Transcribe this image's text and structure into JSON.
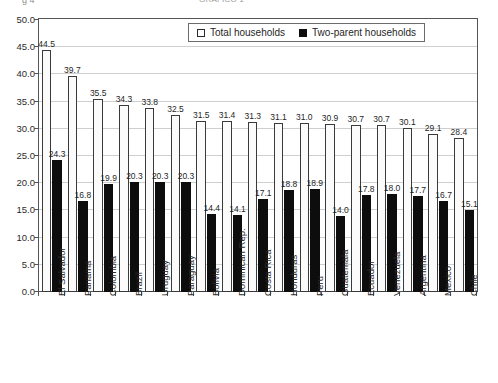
{
  "header": {
    "left_fragment": "g 4",
    "center_fragment": "GRÁFICO 1"
  },
  "legend": {
    "position": "top-center",
    "items": [
      {
        "label": "Total households",
        "marker": "open-square",
        "color": "#ffffff"
      },
      {
        "label": "Two-parent households",
        "marker": "filled-square",
        "color": "#0d0d0d"
      }
    ]
  },
  "footer": {
    "fragment": "Dx"
  },
  "chart_data": {
    "type": "bar",
    "title": "",
    "subtitle": "",
    "xlabel": "",
    "ylabel": "",
    "ylim": [
      0.0,
      50.0
    ],
    "ytick_step": 5.0,
    "ytick_labels": [
      "0.0",
      "5.0",
      "10.0",
      "15.0",
      "20.0",
      "25.0",
      "30.0",
      "35.0",
      "40.0",
      "45.0",
      "50.0"
    ],
    "grid": true,
    "grid_axis": "y",
    "categories": [
      "El Salvador",
      "Panama",
      "Colombia",
      "Brazil",
      "Uruguay",
      "Paraguay",
      "Bolivia",
      "Dominican Rep.",
      "Costa Rica",
      "Honduras",
      "Peru",
      "Guatemala",
      "Ecuador",
      "Venezuela",
      "Argentina",
      "Mexico",
      "Chile"
    ],
    "series": [
      {
        "name": "Total households",
        "color": "#ffffff",
        "edge_color": "#3a3a3a",
        "values": [
          44.5,
          39.7,
          35.5,
          34.3,
          33.8,
          32.5,
          31.5,
          31.4,
          31.3,
          31.1,
          31.0,
          30.9,
          30.7,
          30.7,
          30.1,
          29.1,
          28.4
        ]
      },
      {
        "name": "Two-parent households",
        "color": "#0d0d0d",
        "edge_color": "#0d0d0d",
        "values": [
          24.3,
          16.8,
          19.9,
          20.3,
          20.3,
          20.3,
          14.4,
          14.1,
          17.1,
          18.8,
          18.9,
          14.0,
          17.8,
          18.0,
          17.7,
          16.7,
          15.1
        ]
      }
    ],
    "data_labels": true
  }
}
